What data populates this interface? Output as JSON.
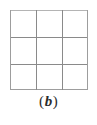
{
  "figure": {
    "caption": {
      "full_text": "(b)",
      "open_paren": "(",
      "label": "b",
      "close_paren": ")"
    },
    "colors": {
      "background": "#ffffff",
      "grid_line": "#8a8a8a",
      "grid_border": "#9d9d9d",
      "grid_border_top": "#b4b4b4",
      "caption_text": "#2b2b2b"
    },
    "grid": {
      "type": "empty-grid",
      "rows": 3,
      "columns": 3,
      "cells_total": 9,
      "cell_contents": [
        [
          "",
          "",
          ""
        ],
        [
          "",
          "",
          ""
        ],
        [
          "",
          "",
          ""
        ]
      ],
      "vertical_line_x": [
        0,
        26,
        52,
        77
      ],
      "horizontal_line_y": [
        0,
        27,
        54,
        79
      ],
      "width_px": 78,
      "height_px": 80,
      "offset_x_px": 10,
      "offset_y_px": 10
    }
  }
}
